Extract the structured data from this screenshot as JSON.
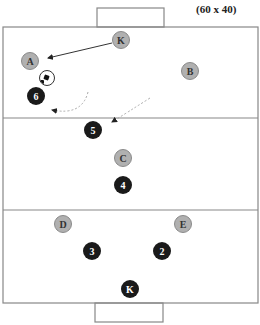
{
  "diagram": {
    "field_dimensions_label": "(60 x 40)",
    "field": {
      "x": 3,
      "y": 27,
      "width": 255,
      "height": 276,
      "line_color": "#888888"
    },
    "zone_lines_y": [
      118,
      210
    ],
    "goals": [
      {
        "name": "top-goal",
        "x": 97,
        "y": 8,
        "width": 67,
        "height": 19
      },
      {
        "name": "bottom-goal",
        "x": 95,
        "y": 303,
        "width": 68,
        "height": 19
      }
    ],
    "players": [
      {
        "id": "K-top",
        "label": "K",
        "team": "attacker",
        "x": 121,
        "y": 40
      },
      {
        "id": "A",
        "label": "A",
        "team": "attacker",
        "x": 30,
        "y": 61
      },
      {
        "id": "B",
        "label": "B",
        "team": "attacker",
        "x": 190,
        "y": 71
      },
      {
        "id": "6",
        "label": "6",
        "team": "defender",
        "x": 36,
        "y": 96
      },
      {
        "id": "5",
        "label": "5",
        "team": "defender",
        "x": 93,
        "y": 130
      },
      {
        "id": "C",
        "label": "C",
        "team": "attacker",
        "x": 123,
        "y": 158
      },
      {
        "id": "4",
        "label": "4",
        "team": "defender",
        "x": 123,
        "y": 185
      },
      {
        "id": "D",
        "label": "D",
        "team": "attacker",
        "x": 63,
        "y": 224
      },
      {
        "id": "E",
        "label": "E",
        "team": "attacker",
        "x": 183,
        "y": 224
      },
      {
        "id": "3",
        "label": "3",
        "team": "defender",
        "x": 92,
        "y": 251
      },
      {
        "id": "2",
        "label": "2",
        "team": "defender",
        "x": 162,
        "y": 251
      },
      {
        "id": "K-bottom",
        "label": "K",
        "team": "defender",
        "x": 130,
        "y": 289
      }
    ],
    "ball": {
      "x": 46,
      "y": 77
    },
    "arrows": [
      {
        "name": "pass-K-to-A",
        "style": "solid",
        "from": [
          112,
          43
        ],
        "to": [
          47,
          58
        ]
      },
      {
        "name": "run-6",
        "style": "dashed",
        "path": "M 88 92 Q 80 118 50 110 L 42 109",
        "tip": [
          40,
          108
        ]
      },
      {
        "name": "run-5",
        "style": "dashed",
        "path": "M 150 98 Q 128 112 112 122",
        "tip": [
          109,
          124
        ]
      }
    ]
  }
}
